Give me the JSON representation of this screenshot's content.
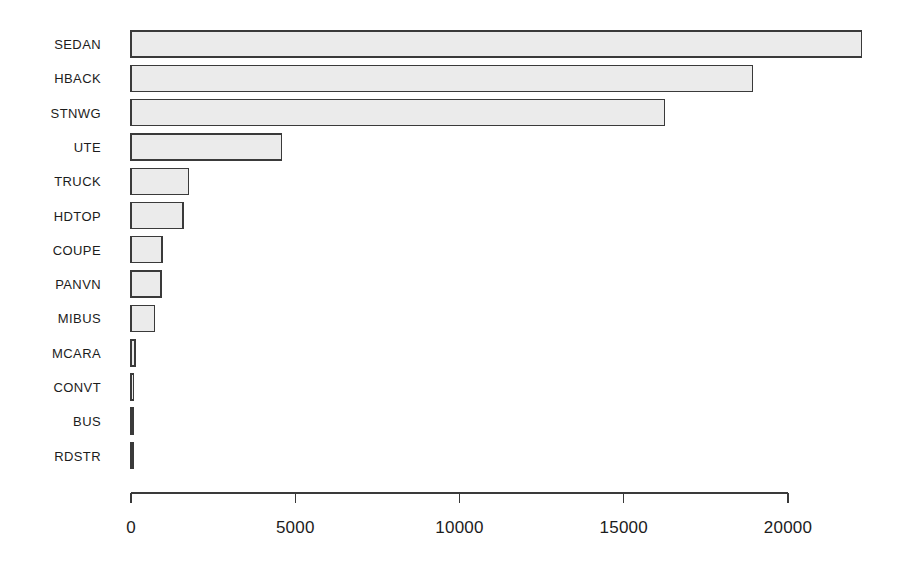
{
  "chart_data": {
    "type": "bar",
    "orientation": "horizontal",
    "title": "",
    "subtitle": "",
    "xlabel": "",
    "ylabel": "",
    "categories": [
      "SEDAN",
      "HBACK",
      "STNWG",
      "UTE",
      "TRUCK",
      "HDTOP",
      "COUPE",
      "PANVN",
      "MIBUS",
      "MCARA",
      "CONVT",
      "BUS",
      "RDSTR"
    ],
    "values": [
      22233,
      18915,
      16234,
      4586,
      1750,
      1579,
      945,
      917,
      717,
      121,
      81,
      48,
      27
    ],
    "series": [
      {
        "name": "count",
        "values": [
          22233,
          18915,
          16234,
          4586,
          1750,
          1579,
          945,
          917,
          717,
          121,
          81,
          48,
          27
        ]
      }
    ],
    "xlim": [
      0,
      20000
    ],
    "xticks": [
      0,
      5000,
      10000,
      15000,
      20000
    ],
    "xtick_labels": [
      "0",
      "5000",
      "10000",
      "15000",
      "20000"
    ],
    "grid": false,
    "legend": false,
    "legend_position": "none",
    "bar_fill_color": "#ebebeb",
    "bar_border_color": "#3a3a3a",
    "axis_color": "#3a3a3a",
    "background_color": "#ffffff",
    "annotations": []
  },
  "axis": {
    "tick_labels": [
      "0",
      "5000",
      "10000",
      "15000",
      "20000"
    ]
  },
  "categories": {
    "labels": [
      "SEDAN",
      "HBACK",
      "STNWG",
      "UTE",
      "TRUCK",
      "HDTOP",
      "COUPE",
      "PANVN",
      "MIBUS",
      "MCARA",
      "CONVT",
      "BUS",
      "RDSTR"
    ]
  }
}
